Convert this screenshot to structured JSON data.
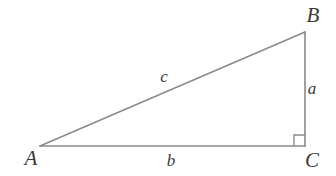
{
  "figure": {
    "kind": "right-triangle-diagram",
    "width": 336,
    "height": 176,
    "background_color": "#ffffff",
    "stroke_color": "#8a8a8a",
    "stroke_width": 1.6,
    "text_color": "#3a3a3a"
  },
  "vertices": {
    "A": {
      "label": "A",
      "x": 40,
      "y": 146
    },
    "B": {
      "label": "B",
      "x": 305,
      "y": 32
    },
    "C": {
      "label": "C",
      "x": 305,
      "y": 146
    }
  },
  "sides": {
    "a": {
      "label": "a",
      "from": "B",
      "to": "C"
    },
    "b": {
      "label": "b",
      "from": "A",
      "to": "C"
    },
    "c": {
      "label": "c",
      "from": "A",
      "to": "B"
    }
  },
  "right_angle": {
    "at": "C",
    "marker_size": 11
  }
}
